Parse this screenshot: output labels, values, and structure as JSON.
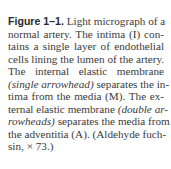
{
  "caption": {
    "figure_label": "Figure 1–1.",
    "lines": [
      {
        "segments": [
          {
            "text": " Light micrograph of a",
            "style": "normal"
          }
        ]
      },
      {
        "segments": [
          {
            "text": "normal artery. The intima (I) con-",
            "style": "normal"
          }
        ]
      },
      {
        "segments": [
          {
            "text": "tains a single layer of endothelial",
            "style": "normal"
          }
        ]
      },
      {
        "segments": [
          {
            "text": "cells lining the lumen of the artery.",
            "style": "normal"
          }
        ]
      },
      {
        "segments": [
          {
            "text": "The internal elastic membrane",
            "style": "normal"
          }
        ]
      },
      {
        "segments": [
          {
            "text": "(single arrowhead)",
            "style": "italic"
          },
          {
            "text": " separates the in-",
            "style": "normal"
          }
        ]
      },
      {
        "segments": [
          {
            "text": "tima from the media (M). The ex-",
            "style": "normal"
          }
        ]
      },
      {
        "segments": [
          {
            "text": "ternal elastic membrane ",
            "style": "normal"
          },
          {
            "text": "(double ar-",
            "style": "italic"
          }
        ]
      },
      {
        "segments": [
          {
            "text": "rowheads)",
            "style": "italic"
          },
          {
            "text": " separates the media from",
            "style": "normal"
          }
        ]
      },
      {
        "segments": [
          {
            "text": "the adventitia (A). (Aldehyde fuch-",
            "style": "normal"
          }
        ]
      },
      {
        "segments": [
          {
            "text": "sin, × 73.)",
            "style": "normal"
          }
        ]
      }
    ]
  }
}
